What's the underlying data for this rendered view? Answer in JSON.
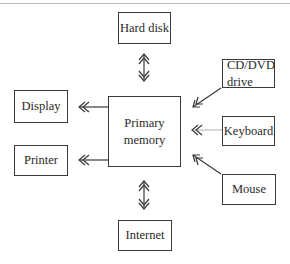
{
  "diagram": {
    "center": {
      "label": "Primary\nmemory"
    },
    "nodes": {
      "hard_disk": {
        "label": "Hard disk",
        "relation": "bidirectional"
      },
      "internet": {
        "label": "Internet",
        "relation": "bidirectional"
      },
      "display": {
        "label": "Display",
        "relation": "output"
      },
      "printer": {
        "label": "Printer",
        "relation": "output"
      },
      "cd_dvd": {
        "label": "CD/DVD\ndrive",
        "relation": "input"
      },
      "keyboard": {
        "label": "Keyboard",
        "relation": "input"
      },
      "mouse": {
        "label": "Mouse",
        "relation": "input"
      }
    },
    "colors": {
      "line": "#3a3a3a",
      "text": "#2a2a2a",
      "rule": "#bdbdbd"
    }
  }
}
